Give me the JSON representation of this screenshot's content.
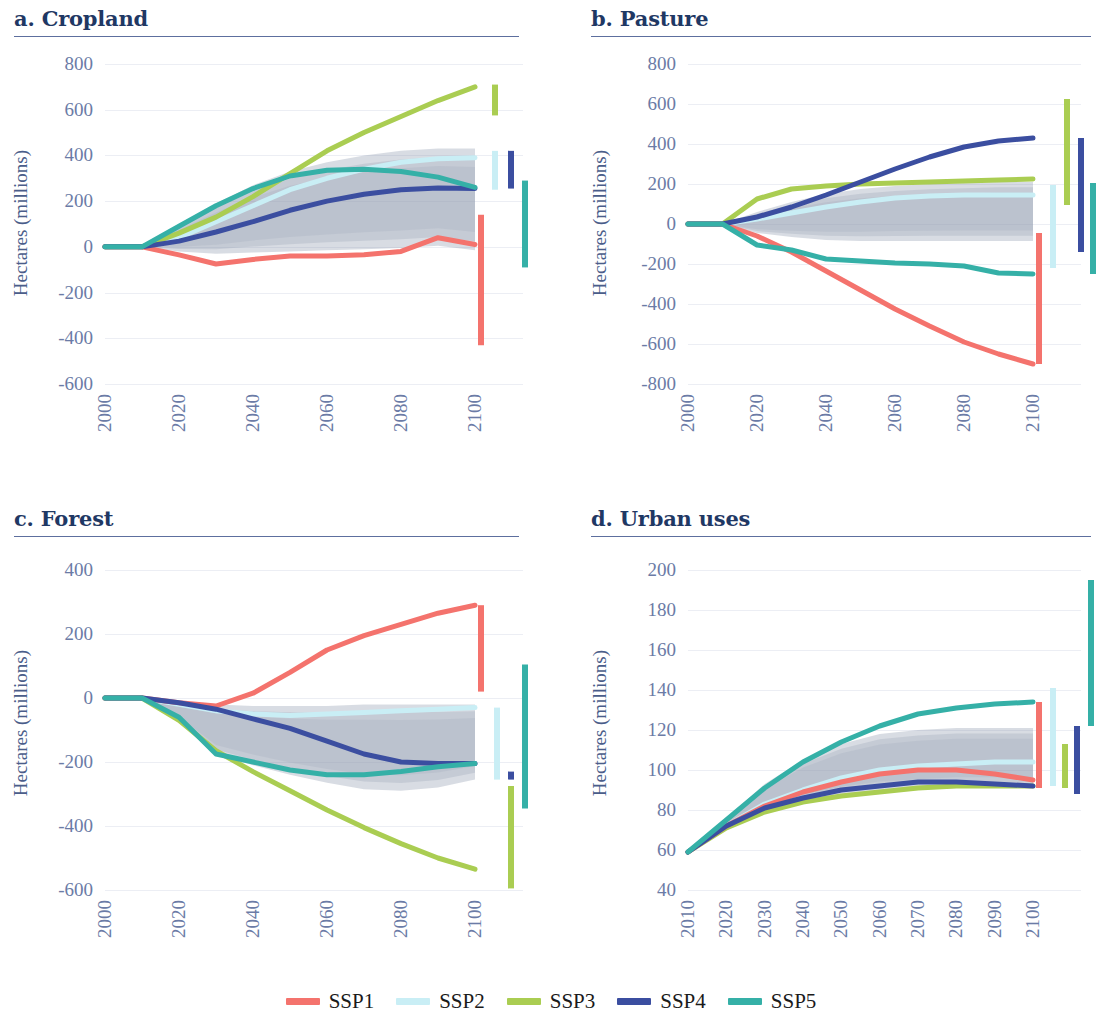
{
  "figure": {
    "ylabel": "Hectares (millions)",
    "series_colors": {
      "SSP1": "#f4736d",
      "SSP2": "#c9eef5",
      "SSP3": "#aacd52",
      "SSP4": "#3b4ea0",
      "SSP5": "#35b0a7"
    }
  },
  "legend": {
    "items": [
      {
        "label": "SSP1",
        "color": "#f4736d"
      },
      {
        "label": "SSP2",
        "color": "#c9eef5"
      },
      {
        "label": "SSP3",
        "color": "#aacd52"
      },
      {
        "label": "SSP4",
        "color": "#3b4ea0"
      },
      {
        "label": "SSP5",
        "color": "#35b0a7"
      }
    ]
  },
  "panels": {
    "a": {
      "title": "a. Cropland"
    },
    "b": {
      "title": "b. Pasture"
    },
    "c": {
      "title": "c. Forest"
    },
    "d": {
      "title": "d. Urban uses"
    }
  },
  "chart_data": [
    {
      "type": "line",
      "panel": "a",
      "title": "a. Cropland",
      "xlabel": "",
      "ylabel": "Hectares (millions)",
      "xlim": [
        2000,
        2100
      ],
      "ylim": [
        -600,
        800
      ],
      "yticks": [
        800,
        600,
        400,
        200,
        0,
        -200,
        -400,
        -600
      ],
      "xticks": [
        2000,
        2020,
        2040,
        2060,
        2080,
        2100
      ],
      "grid": true,
      "legend_position": "bottom-figure",
      "x": [
        2000,
        2010,
        2020,
        2030,
        2040,
        2050,
        2060,
        2070,
        2080,
        2090,
        2100
      ],
      "series": [
        {
          "name": "SSP1",
          "color": "#f4736d",
          "values": [
            0,
            0,
            -35,
            -75,
            -55,
            -40,
            -40,
            -35,
            -20,
            40,
            10
          ]
        },
        {
          "name": "SSP2",
          "color": "#c9eef5",
          "values": [
            0,
            0,
            40,
            110,
            180,
            250,
            300,
            340,
            370,
            385,
            390
          ]
        },
        {
          "name": "SSP3",
          "color": "#aacd52",
          "values": [
            0,
            0,
            60,
            130,
            220,
            320,
            420,
            500,
            570,
            640,
            700
          ]
        },
        {
          "name": "SSP4",
          "color": "#3b4ea0",
          "values": [
            0,
            0,
            25,
            65,
            110,
            160,
            200,
            230,
            250,
            258,
            255
          ]
        },
        {
          "name": "SSP5",
          "color": "#35b0a7",
          "values": [
            0,
            0,
            90,
            180,
            255,
            310,
            335,
            340,
            330,
            305,
            260
          ]
        }
      ],
      "uncertainty_band": {
        "label": "model range",
        "upper": [
          0,
          0,
          95,
          190,
          270,
          330,
          370,
          400,
          420,
          430,
          430
        ],
        "lower": [
          0,
          0,
          -20,
          -30,
          -25,
          -20,
          -15,
          -10,
          -5,
          5,
          -15
        ]
      },
      "error_bars": [
        {
          "name": "SSP1",
          "color": "#f4736d",
          "low": -430,
          "high": 140
        },
        {
          "name": "SSP2",
          "color": "#c9eef5",
          "low": 250,
          "high": 420
        },
        {
          "name": "SSP3",
          "color": "#aacd52",
          "low": 575,
          "high": 710
        },
        {
          "name": "SSP4",
          "color": "#3b4ea0",
          "low": 255,
          "high": 420
        },
        {
          "name": "SSP5",
          "color": "#35b0a7",
          "low": -90,
          "high": 290
        }
      ]
    },
    {
      "type": "line",
      "panel": "b",
      "title": "b. Pasture",
      "xlabel": "",
      "ylabel": "Hectares (millions)",
      "xlim": [
        2000,
        2100
      ],
      "ylim": [
        -800,
        800
      ],
      "yticks": [
        800,
        600,
        400,
        200,
        0,
        -200,
        -400,
        -600,
        -800
      ],
      "xticks": [
        2000,
        2020,
        2040,
        2060,
        2080,
        2100
      ],
      "grid": true,
      "legend_position": "bottom-figure",
      "x": [
        2000,
        2010,
        2020,
        2030,
        2040,
        2050,
        2060,
        2070,
        2080,
        2090,
        2100
      ],
      "series": [
        {
          "name": "SSP1",
          "color": "#f4736d",
          "values": [
            0,
            0,
            -60,
            -140,
            -235,
            -330,
            -425,
            -510,
            -590,
            -650,
            -700
          ]
        },
        {
          "name": "SSP2",
          "color": "#c9eef5",
          "values": [
            0,
            0,
            25,
            55,
            85,
            110,
            130,
            140,
            145,
            145,
            145
          ]
        },
        {
          "name": "SSP3",
          "color": "#aacd52",
          "values": [
            0,
            0,
            125,
            175,
            190,
            200,
            205,
            210,
            215,
            220,
            225
          ]
        },
        {
          "name": "SSP4",
          "color": "#3b4ea0",
          "values": [
            0,
            0,
            35,
            85,
            145,
            210,
            275,
            335,
            385,
            415,
            430
          ]
        },
        {
          "name": "SSP5",
          "color": "#35b0a7",
          "values": [
            0,
            0,
            -105,
            -130,
            -175,
            -185,
            -195,
            -200,
            -210,
            -245,
            -250
          ]
        }
      ],
      "uncertainty_band": {
        "label": "model range",
        "upper": [
          0,
          0,
          60,
          110,
          150,
          175,
          190,
          200,
          205,
          210,
          210
        ],
        "lower": [
          0,
          0,
          -45,
          -65,
          -80,
          -85,
          -85,
          -85,
          -85,
          -85,
          -85
        ]
      },
      "error_bars": [
        {
          "name": "SSP1",
          "color": "#f4736d",
          "low": -700,
          "high": -45
        },
        {
          "name": "SSP2",
          "color": "#c9eef5",
          "low": -220,
          "high": 195
        },
        {
          "name": "SSP3",
          "color": "#aacd52",
          "low": 95,
          "high": 625
        },
        {
          "name": "SSP4",
          "color": "#3b4ea0",
          "low": -140,
          "high": 430
        },
        {
          "name": "SSP5",
          "color": "#35b0a7",
          "low": -250,
          "high": 205
        }
      ]
    },
    {
      "type": "line",
      "panel": "c",
      "title": "c. Forest",
      "xlabel": "",
      "ylabel": "Hectares (millions)",
      "xlim": [
        2000,
        2100
      ],
      "ylim": [
        -600,
        400
      ],
      "yticks": [
        400,
        200,
        0,
        -200,
        -400,
        -600
      ],
      "xticks": [
        2000,
        2020,
        2040,
        2060,
        2080,
        2100
      ],
      "grid": true,
      "legend_position": "bottom-figure",
      "x": [
        2000,
        2010,
        2020,
        2030,
        2040,
        2050,
        2060,
        2070,
        2080,
        2090,
        2100
      ],
      "series": [
        {
          "name": "SSP1",
          "color": "#f4736d",
          "values": [
            0,
            0,
            -15,
            -25,
            15,
            80,
            150,
            195,
            230,
            265,
            290
          ]
        },
        {
          "name": "SSP2",
          "color": "#c9eef5",
          "values": [
            0,
            0,
            -20,
            -40,
            -50,
            -55,
            -50,
            -45,
            -40,
            -35,
            -30
          ]
        },
        {
          "name": "SSP3",
          "color": "#aacd52",
          "values": [
            0,
            0,
            -70,
            -165,
            -230,
            -290,
            -350,
            -405,
            -455,
            -500,
            -535
          ]
        },
        {
          "name": "SSP4",
          "color": "#3b4ea0",
          "values": [
            0,
            0,
            -15,
            -35,
            -65,
            -95,
            -135,
            -175,
            -200,
            -205,
            -205
          ]
        },
        {
          "name": "SSP5",
          "color": "#35b0a7",
          "values": [
            0,
            0,
            -60,
            -175,
            -200,
            -225,
            -240,
            -240,
            -230,
            -215,
            -205
          ]
        }
      ],
      "uncertainty_band": {
        "label": "model range",
        "upper": [
          0,
          0,
          -10,
          -20,
          -25,
          -25,
          -25,
          -20,
          -20,
          -20,
          -20
        ],
        "lower": [
          0,
          0,
          -70,
          -175,
          -210,
          -240,
          -265,
          -285,
          -290,
          -280,
          -255
        ]
      },
      "error_bars": [
        {
          "name": "SSP1",
          "color": "#f4736d",
          "low": 20,
          "high": 290
        },
        {
          "name": "SSP2",
          "color": "#c9eef5",
          "low": -255,
          "high": -30
        },
        {
          "name": "SSP3",
          "color": "#aacd52",
          "low": -595,
          "high": -275
        },
        {
          "name": "SSP4",
          "color": "#3b4ea0",
          "low": -255,
          "high": -230
        },
        {
          "name": "SSP5",
          "color": "#35b0a7",
          "low": -345,
          "high": 105
        }
      ]
    },
    {
      "type": "line",
      "panel": "d",
      "title": "d. Urban uses",
      "xlabel": "",
      "ylabel": "Hectares (millions)",
      "xlim": [
        2010,
        2100
      ],
      "ylim": [
        40,
        200
      ],
      "yticks": [
        200,
        180,
        160,
        140,
        120,
        100,
        80,
        60,
        40
      ],
      "xticks": [
        2010,
        2020,
        2030,
        2040,
        2050,
        2060,
        2070,
        2080,
        2090,
        2100
      ],
      "grid": true,
      "legend_position": "bottom-figure",
      "x": [
        2010,
        2020,
        2030,
        2040,
        2050,
        2060,
        2070,
        2080,
        2090,
        2100
      ],
      "series": [
        {
          "name": "SSP1",
          "color": "#f4736d",
          "values": [
            59,
            72,
            82,
            89,
            94,
            98,
            100,
            100,
            98,
            95
          ]
        },
        {
          "name": "SSP2",
          "color": "#c9eef5",
          "values": [
            59,
            72,
            83,
            90,
            96,
            100,
            102,
            103,
            104,
            104
          ]
        },
        {
          "name": "SSP3",
          "color": "#aacd52",
          "values": [
            59,
            71,
            79,
            84,
            87,
            89,
            91,
            92,
            92,
            92
          ]
        },
        {
          "name": "SSP4",
          "color": "#3b4ea0",
          "values": [
            59,
            72,
            81,
            86,
            90,
            92,
            94,
            94,
            93,
            92
          ]
        },
        {
          "name": "SSP5",
          "color": "#35b0a7",
          "values": [
            59,
            75,
            91,
            104,
            114,
            122,
            128,
            131,
            133,
            134
          ]
        }
      ],
      "uncertainty_band": {
        "label": "model range",
        "upper": [
          59,
          76,
          93,
          105,
          113,
          118,
          120,
          121,
          121,
          121
        ],
        "lower": [
          59,
          71,
          79,
          84,
          87,
          89,
          90,
          91,
          91,
          91
        ]
      },
      "error_bars": [
        {
          "name": "SSP1",
          "color": "#f4736d",
          "low": 91,
          "high": 134
        },
        {
          "name": "SSP2",
          "color": "#c9eef5",
          "low": 92,
          "high": 141
        },
        {
          "name": "SSP3",
          "color": "#aacd52",
          "low": 91,
          "high": 113
        },
        {
          "name": "SSP4",
          "color": "#3b4ea0",
          "low": 88,
          "high": 122
        },
        {
          "name": "SSP5",
          "color": "#35b0a7",
          "low": 122,
          "high": 195
        }
      ]
    }
  ]
}
